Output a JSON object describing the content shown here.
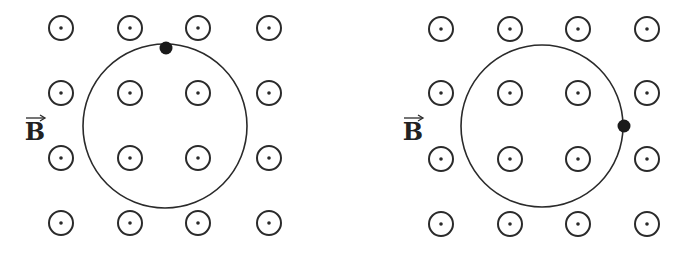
{
  "panels": [
    {
      "id": "left",
      "field_label": "B",
      "field_direction": "out-of-page",
      "label_pos": [
        35,
        140
      ],
      "grid_x": [
        61,
        130,
        198,
        269
      ],
      "grid_y": [
        28,
        93,
        158,
        223
      ],
      "orbit": {
        "cx": 165,
        "cy": 126,
        "r": 82
      },
      "particle": {
        "x": 166,
        "y": 48,
        "position": "top"
      }
    },
    {
      "id": "right",
      "field_label": "B",
      "field_direction": "out-of-page",
      "label_pos": [
        413,
        140
      ],
      "grid_x": [
        441,
        510,
        578,
        647
      ],
      "grid_y": [
        29,
        93,
        159,
        224
      ],
      "orbit": {
        "cx": 542,
        "cy": 126,
        "r": 81
      },
      "particle": {
        "x": 624,
        "y": 126,
        "position": "right"
      }
    }
  ],
  "colors": {
    "stroke": "#2a2a2a",
    "particle": "#1a1a1a",
    "background": "#ffffff"
  }
}
